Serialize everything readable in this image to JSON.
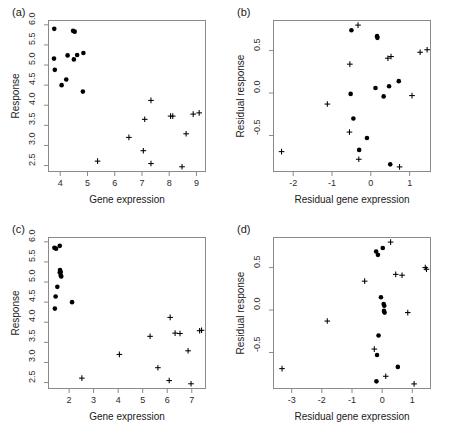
{
  "figure": {
    "panels": [
      {
        "tag": "(a)",
        "xlabel": "Gene expression",
        "ylabel": "Response",
        "xticks": [
          "4",
          "5",
          "6",
          "7",
          "8",
          "9"
        ],
        "xtickvals": [
          4,
          5,
          6,
          7,
          8,
          9
        ],
        "yticks": [
          "2.5",
          "3.0",
          "3.5",
          "4.0",
          "4.5",
          "5.0",
          "5.5",
          "6.0"
        ],
        "ytickvals": [
          2.5,
          3.0,
          3.5,
          4.0,
          4.5,
          5.0,
          5.5,
          6.0
        ],
        "xlim": [
          3.55,
          9.35
        ],
        "ylim": [
          2.34,
          6.12
        ],
        "chart_data": {
          "type": "scatter",
          "title": "(a)",
          "xlabel": "Gene expression",
          "ylabel": "Response",
          "xlim": [
            3.55,
            9.35
          ],
          "ylim": [
            2.34,
            6.12
          ],
          "grid": false,
          "legend": "none",
          "series": [
            {
              "name": "group-dot",
              "marker": "filled-circle",
              "points": [
                [
                  3.78,
                  5.9
                ],
                [
                  4.47,
                  5.85
                ],
                [
                  4.53,
                  5.83
                ],
                [
                  3.77,
                  5.16
                ],
                [
                  4.27,
                  5.24
                ],
                [
                  4.5,
                  5.14
                ],
                [
                  4.62,
                  5.25
                ],
                [
                  4.85,
                  5.3
                ],
                [
                  3.8,
                  4.88
                ],
                [
                  4.05,
                  4.5
                ],
                [
                  4.22,
                  4.64
                ],
                [
                  4.83,
                  4.34
                ]
              ]
            },
            {
              "name": "group-cross",
              "marker": "plus",
              "points": [
                [
                  7.33,
                  4.12
                ],
                [
                  7.1,
                  3.65
                ],
                [
                  8.05,
                  3.73
                ],
                [
                  8.13,
                  3.73
                ],
                [
                  8.88,
                  3.78
                ],
                [
                  9.1,
                  3.81
                ],
                [
                  6.52,
                  3.2
                ],
                [
                  8.62,
                  3.29
                ],
                [
                  7.05,
                  2.87
                ],
                [
                  7.33,
                  2.55
                ],
                [
                  5.37,
                  2.61
                ],
                [
                  8.47,
                  2.47
                ]
              ]
            }
          ]
        }
      },
      {
        "tag": "(b)",
        "xlabel": "Residual gene expression",
        "ylabel": "Residual response",
        "xticks": [
          "-2",
          "-1",
          "0",
          "1"
        ],
        "xtickvals": [
          -2,
          -1,
          0,
          1
        ],
        "yticks": [
          "-0.5",
          "0.0",
          "0.5"
        ],
        "ytickvals": [
          -0.5,
          0.0,
          0.5
        ],
        "xlim": [
          -2.52,
          1.55
        ],
        "ylim": [
          -0.93,
          0.86
        ],
        "chart_data": {
          "type": "scatter",
          "title": "(b)",
          "xlabel": "Residual gene expression",
          "ylabel": "Residual response",
          "xlim": [
            -2.52,
            1.55
          ],
          "ylim": [
            -0.93,
            0.86
          ],
          "grid": false,
          "legend": "none",
          "series": [
            {
              "name": "group-dot",
              "marker": "filled-circle",
              "points": [
                [
                  -0.5,
                  0.74
                ],
                [
                  0.16,
                  0.67
                ],
                [
                  0.17,
                  0.65
                ],
                [
                  -0.52,
                  -0.01
                ],
                [
                  0.12,
                  0.06
                ],
                [
                  0.33,
                  -0.04
                ],
                [
                  0.47,
                  0.08
                ],
                [
                  0.72,
                  0.14
                ],
                [
                  -0.45,
                  -0.3
                ],
                [
                  -0.1,
                  -0.53
                ],
                [
                  -0.3,
                  -0.67
                ],
                [
                  0.5,
                  -0.84
                ]
              ]
            },
            {
              "name": "group-cross",
              "marker": "plus",
              "points": [
                [
                  -0.33,
                  0.8
                ],
                [
                  -0.54,
                  0.34
                ],
                [
                  0.44,
                  0.41
                ],
                [
                  0.52,
                  0.43
                ],
                [
                  1.27,
                  0.48
                ],
                [
                  1.45,
                  0.51
                ],
                [
                  -1.12,
                  -0.13
                ],
                [
                  1.06,
                  -0.03
                ],
                [
                  -0.55,
                  -0.46
                ],
                [
                  -0.31,
                  -0.78
                ],
                [
                  -2.3,
                  -0.69
                ],
                [
                  0.74,
                  -0.87
                ]
              ]
            }
          ]
        }
      },
      {
        "tag": "(c)",
        "xlabel": "Gene expression",
        "ylabel": "Response",
        "xticks": [
          "2",
          "3",
          "4",
          "5",
          "6",
          "7"
        ],
        "xtickvals": [
          2,
          3,
          4,
          5,
          6,
          7
        ],
        "yticks": [
          "2.5",
          "3.0",
          "3.5",
          "4.0",
          "4.5",
          "5.0",
          "5.5",
          "6.0"
        ],
        "ytickvals": [
          2.5,
          3.0,
          3.5,
          4.0,
          4.5,
          5.0,
          5.5,
          6.0
        ],
        "xlim": [
          1.14,
          7.58
        ],
        "ylim": [
          2.34,
          6.12
        ],
        "chart_data": {
          "type": "scatter",
          "title": "(c)",
          "xlabel": "Gene expression",
          "ylabel": "Response",
          "xlim": [
            1.14,
            7.58
          ],
          "ylim": [
            2.34,
            6.12
          ],
          "grid": false,
          "legend": "none",
          "series": [
            {
              "name": "group-dot",
              "marker": "filled-circle",
              "points": [
                [
                  1.4,
                  5.85
                ],
                [
                  1.47,
                  5.83
                ],
                [
                  1.62,
                  5.9
                ],
                [
                  1.63,
                  5.3
                ],
                [
                  1.66,
                  5.25
                ],
                [
                  1.68,
                  5.14
                ],
                [
                  1.62,
                  5.24
                ],
                [
                  1.52,
                  4.88
                ],
                [
                  1.45,
                  4.64
                ],
                [
                  1.42,
                  4.34
                ],
                [
                  2.12,
                  4.5
                ],
                [
                  1.66,
                  5.16
                ]
              ]
            },
            {
              "name": "group-cross",
              "marker": "plus",
              "points": [
                [
                  6.12,
                  4.12
                ],
                [
                  5.3,
                  3.65
                ],
                [
                  6.32,
                  3.73
                ],
                [
                  6.52,
                  3.72
                ],
                [
                  7.32,
                  3.79
                ],
                [
                  7.4,
                  3.8
                ],
                [
                  4.05,
                  3.2
                ],
                [
                  6.85,
                  3.29
                ],
                [
                  5.62,
                  2.87
                ],
                [
                  6.08,
                  2.55
                ],
                [
                  2.52,
                  2.61
                ],
                [
                  6.97,
                  2.47
                ]
              ]
            }
          ]
        }
      },
      {
        "tag": "(d)",
        "xlabel": "Residual gene expression",
        "ylabel": "Residual response",
        "xticks": [
          "-3",
          "-2",
          "-1",
          "0",
          "1"
        ],
        "xtickvals": [
          -3,
          -2,
          -1,
          0,
          1
        ],
        "yticks": [
          "-0.5",
          "0.0",
          "0.5"
        ],
        "ytickvals": [
          -0.5,
          0.0,
          0.5
        ],
        "xlim": [
          -3.62,
          1.62
        ],
        "ylim": [
          -0.93,
          0.86
        ],
        "chart_data": {
          "type": "scatter",
          "title": "(d)",
          "xlabel": "Residual gene expression",
          "ylabel": "Residual response",
          "xlim": [
            -3.62,
            1.62
          ],
          "ylim": [
            -0.93,
            0.86
          ],
          "grid": false,
          "legend": "none",
          "series": [
            {
              "name": "group-dot",
              "marker": "filled-circle",
              "points": [
                [
                  -0.2,
                  0.69
                ],
                [
                  -0.14,
                  0.65
                ],
                [
                  0.02,
                  0.73
                ],
                [
                  -0.04,
                  0.15
                ],
                [
                  0.05,
                  0.07
                ],
                [
                  0.07,
                  0.05
                ],
                [
                  0.06,
                  -0.01
                ],
                [
                  0.08,
                  -0.03
                ],
                [
                  -0.12,
                  -0.3
                ],
                [
                  -0.17,
                  -0.53
                ],
                [
                  0.52,
                  -0.67
                ],
                [
                  -0.19,
                  -0.84
                ]
              ]
            },
            {
              "name": "group-cross",
              "marker": "plus",
              "points": [
                [
                  0.28,
                  0.8
                ],
                [
                  -0.58,
                  0.34
                ],
                [
                  0.45,
                  0.42
                ],
                [
                  0.66,
                  0.41
                ],
                [
                  1.43,
                  0.5
                ],
                [
                  1.47,
                  0.48
                ],
                [
                  -1.82,
                  -0.13
                ],
                [
                  0.85,
                  -0.03
                ],
                [
                  -0.26,
                  -0.46
                ],
                [
                  0.12,
                  -0.78
                ],
                [
                  -3.32,
                  -0.69
                ],
                [
                  1.06,
                  -0.87
                ]
              ]
            }
          ]
        }
      }
    ]
  }
}
